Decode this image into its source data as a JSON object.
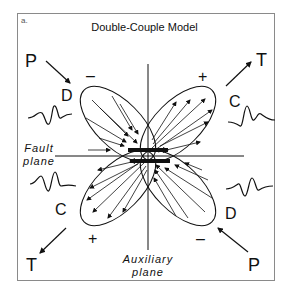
{
  "panel_label": "a.",
  "title": "Double-Couple Model",
  "labels": {
    "p_top_left": "P",
    "t_top_right": "T",
    "t_bottom_left": "T",
    "p_bottom_right": "P",
    "d_upper_left": "D",
    "c_upper_right": "C",
    "c_lower_left": "C",
    "d_lower_right": "D",
    "minus_upper_left": "–",
    "plus_upper_right": "+",
    "plus_lower_left": "+",
    "minus_lower_right": "–"
  },
  "fault_plane": {
    "line1": "Fault",
    "line2": "plane"
  },
  "auxiliary_plane": {
    "line1": "Auxiliary",
    "line2": "plane"
  },
  "colors": {
    "ink": "#111111",
    "frame": "#8a8a8a",
    "background": "#ffffff"
  }
}
